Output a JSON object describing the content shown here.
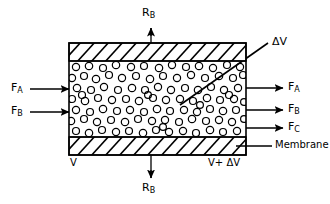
{
  "figure": {
    "type": "technical-diagram",
    "background_color": "#ffffff",
    "line_color": "#000000"
  },
  "labels": {
    "top_flux": {
      "base": "R",
      "sub": "B"
    },
    "bottom_flux": {
      "base": "R",
      "sub": "B"
    },
    "delta_v_callout": "ΔV",
    "membrane": "Membrane",
    "volume_left": "V",
    "volume_right": "V+ ΔV"
  },
  "inlet_streams": [
    {
      "base": "F",
      "sub": "A",
      "y": 89
    },
    {
      "base": "F",
      "sub": "B",
      "y": 112
    }
  ],
  "outlet_streams": [
    {
      "base": "F",
      "sub": "A",
      "y": 88
    },
    {
      "base": "F",
      "sub": "B",
      "y": 110
    },
    {
      "base": "F",
      "sub": "C",
      "y": 128
    }
  ],
  "geometry": {
    "box_left": 69,
    "box_right": 246,
    "box_top": 43,
    "box_bottom": 155,
    "membrane_top_band": [
      43,
      61
    ],
    "membrane_bottom_band": [
      137,
      155
    ],
    "hatch_spacing": 14,
    "vertical_axis_x": 151,
    "particle_diameter": 7.5
  },
  "particles": {
    "description": "catalyst pellets drawn as open circles",
    "count": 96
  }
}
